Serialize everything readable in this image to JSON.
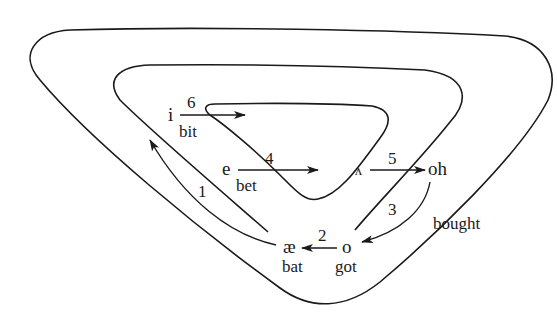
{
  "diagram": {
    "nodes": [
      {
        "id": "i",
        "vowel": "i",
        "word": "bit"
      },
      {
        "id": "e",
        "vowel": "e",
        "word": "bet"
      },
      {
        "id": "ae",
        "vowel": "æ",
        "word": "bat"
      },
      {
        "id": "o",
        "vowel": "o",
        "word": "got"
      },
      {
        "id": "wedge",
        "vowel": "ʌ",
        "word": ""
      },
      {
        "id": "oh",
        "vowel": "oh",
        "word": ""
      },
      {
        "id": "bought",
        "vowel": "",
        "word": "bought"
      }
    ],
    "arrows": [
      {
        "number": "1",
        "from": "ae",
        "to": "upper-left"
      },
      {
        "number": "2",
        "from": "o",
        "to": "ae"
      },
      {
        "number": "3",
        "from": "oh",
        "to": "o"
      },
      {
        "number": "4",
        "from": "e",
        "to": "right"
      },
      {
        "number": "5",
        "from": "wedge",
        "to": "oh"
      },
      {
        "number": "6",
        "from": "i",
        "to": "right"
      }
    ],
    "labels": {
      "i": "i",
      "bit": "bit",
      "six": "6",
      "e": "e",
      "bet": "bet",
      "four": "4",
      "wedge": "ʌ",
      "five": "5",
      "oh": "oh",
      "three": "3",
      "bought": "bought",
      "ae": "æ",
      "bat": "bat",
      "two": "2",
      "o": "o",
      "got": "got",
      "one": "1"
    },
    "colors": {
      "stroke": "#1a1a1a",
      "background": "#ffffff"
    }
  }
}
